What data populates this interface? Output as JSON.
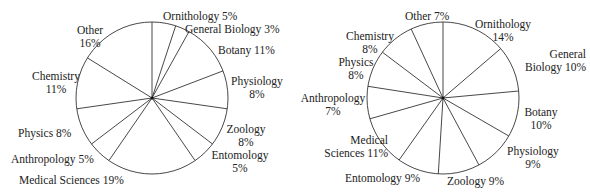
{
  "chart_data": [
    {
      "type": "pie",
      "title": "",
      "start_angle_deg": 0,
      "direction": "clockwise",
      "categories": [
        "Ornithology",
        "General Biology",
        "Botany",
        "Physiology",
        "Zoology",
        "Entomology",
        "Medical Sciences",
        "Anthropology",
        "Physics",
        "Chemistry",
        "Other"
      ],
      "values": [
        5,
        3,
        11,
        8,
        8,
        5,
        19,
        5,
        8,
        11,
        16
      ],
      "labels": {
        "ornithology": "Ornithology  5%",
        "general_biology": "General Biology  3%",
        "botany": "Botany  11%",
        "physiology_name": "Physiology",
        "physiology_pct": "8%",
        "zoology_name": "Zoology",
        "zoology_pct": "8%",
        "entomology_name": "Entomology",
        "entomology_pct": "5%",
        "medical_sciences": "Medical Sciences  19%",
        "anthropology": "Anthropology  5%",
        "physics": "Physics  8%",
        "chemistry_name": "Chemistry",
        "chemistry_pct": "11%",
        "other_name": "Other",
        "other_pct": "16%"
      }
    },
    {
      "type": "pie",
      "title": "",
      "start_angle_deg": 0,
      "direction": "clockwise",
      "categories": [
        "Ornithology",
        "General Biology",
        "Botany",
        "Physiology",
        "Zoology",
        "Entomology",
        "Medical Sciences",
        "Anthropology",
        "Physics",
        "Chemistry",
        "Other"
      ],
      "values": [
        14,
        10,
        10,
        9,
        9,
        9,
        11,
        7,
        8,
        8,
        7
      ],
      "labels": {
        "ornithology_name": "Ornithology",
        "ornithology_pct": "14%",
        "general_biology_l1": "General",
        "general_biology_l2": "Biology  10%",
        "botany_name": "Botany",
        "botany_pct": "10%",
        "physiology_name": "Physiology",
        "physiology_pct": "9%",
        "zoology": "Zoology  9%",
        "entomology": "Entomology  9%",
        "medical_l1": "Medical",
        "medical_l2": "Sciences  11%",
        "anthropology_name": "Anthropology",
        "anthropology_pct": "7%",
        "physics_name": "Physics",
        "physics_pct": "8%",
        "chemistry_name": "Chemistry",
        "chemistry_pct": "8%",
        "other": "Other  7%"
      }
    }
  ]
}
